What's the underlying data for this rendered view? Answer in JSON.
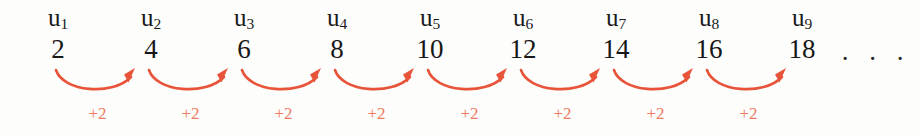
{
  "figure": {
    "colors": {
      "background": "#fdfdfc",
      "text": "#1a1a1a",
      "arrow": "#e8543a",
      "step_label": "#ef7a62"
    },
    "ellipsis": ". . .",
    "terms": [
      {
        "label_base": "u",
        "index": "1",
        "value": "2"
      },
      {
        "label_base": "u",
        "index": "2",
        "value": "4"
      },
      {
        "label_base": "u",
        "index": "3",
        "value": "6"
      },
      {
        "label_base": "u",
        "index": "4",
        "value": "8"
      },
      {
        "label_base": "u",
        "index": "5",
        "value": "10"
      },
      {
        "label_base": "u",
        "index": "6",
        "value": "12"
      },
      {
        "label_base": "u",
        "index": "7",
        "value": "14"
      },
      {
        "label_base": "u",
        "index": "8",
        "value": "16"
      },
      {
        "label_base": "u",
        "index": "9",
        "value": "18"
      }
    ],
    "steps": [
      {
        "label": "+2"
      },
      {
        "label": "+2"
      },
      {
        "label": "+2"
      },
      {
        "label": "+2"
      },
      {
        "label": "+2"
      },
      {
        "label": "+2"
      },
      {
        "label": "+2"
      },
      {
        "label": "+2"
      }
    ]
  },
  "chart_data": {
    "type": "line",
    "categories": [
      "u1",
      "u2",
      "u3",
      "u4",
      "u5",
      "u6",
      "u7",
      "u8",
      "u9"
    ],
    "values": [
      2,
      4,
      6,
      8,
      10,
      12,
      14,
      16,
      18
    ],
    "annotations": [
      "+2",
      "+2",
      "+2",
      "+2",
      "+2",
      "+2",
      "+2",
      "+2"
    ],
    "xlabel": "",
    "ylabel": "",
    "grid": false,
    "legend": false
  }
}
